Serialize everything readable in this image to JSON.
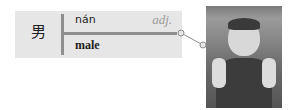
{
  "card": {
    "hanzi": "男",
    "pinyin": "nán",
    "part_of_speech": "adj.",
    "meaning": "male"
  },
  "image": {
    "description": "boy clenching fists"
  },
  "colors": {
    "card_bg": "#e6e6e6",
    "bar": "#8e8e8e",
    "pos_text": "#999999"
  }
}
